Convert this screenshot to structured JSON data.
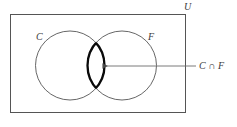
{
  "figure": {
    "type": "venn-diagram",
    "title": "",
    "background_color": "#ffffff",
    "universe": {
      "label": "U",
      "shape": "rectangle",
      "stroke_color": "#555555"
    },
    "sets": [
      {
        "id": "C",
        "label": "C",
        "stroke_color": "#555555",
        "fill": "none"
      },
      {
        "id": "F",
        "label": "F",
        "stroke_color": "#555555",
        "fill": "none"
      }
    ],
    "highlight": {
      "region": "intersection",
      "label": "C ∩ F",
      "stroke_color": "#000000",
      "fill": "none",
      "emphasis": "thick-outline"
    },
    "annotation": {
      "text": "C ∩ F",
      "arrow": "points-left-into-intersection",
      "line_color": "#6b6b6b"
    }
  }
}
